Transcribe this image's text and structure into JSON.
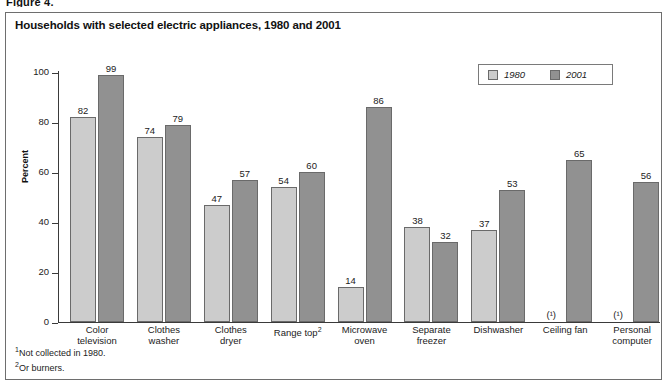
{
  "figure_caption": "Figure 4.",
  "chart_title": "Households with selected electric appliances, 1980 and 2001",
  "legend": {
    "entries": [
      {
        "label": "1980",
        "color": "#cccccc"
      },
      {
        "label": "2001",
        "color": "#919191"
      }
    ]
  },
  "y_axis": {
    "title": "Percent",
    "ticks": [
      "0",
      "20",
      "40",
      "60",
      "80",
      "100"
    ]
  },
  "footnotes": [
    {
      "marker": "1",
      "text": "Not collected in 1980."
    },
    {
      "marker": "2",
      "text": "Or burners."
    }
  ],
  "not_available_marker": "(¹)",
  "chart_data": {
    "type": "bar",
    "title": "Households with selected electric appliances, 1980 and 2001",
    "xlabel": "",
    "ylabel": "Percent",
    "ylim": [
      0,
      100
    ],
    "yticks": [
      0,
      20,
      40,
      60,
      80,
      100
    ],
    "grid": false,
    "legend_position": "top-right",
    "categories": [
      "Color television",
      "Clothes washer",
      "Clothes dryer",
      "Range top",
      "Microwave oven",
      "Separate freezer",
      "Dishwasher",
      "Ceiling fan",
      "Personal computer"
    ],
    "category_labels": [
      {
        "line1": "Color",
        "line2": "television",
        "footnote": ""
      },
      {
        "line1": "Clothes",
        "line2": "washer",
        "footnote": ""
      },
      {
        "line1": "Clothes",
        "line2": "dryer",
        "footnote": ""
      },
      {
        "line1": "Range top",
        "line2": "",
        "footnote": "2"
      },
      {
        "line1": "Microwave",
        "line2": "oven",
        "footnote": ""
      },
      {
        "line1": "Separate",
        "line2": "freezer",
        "footnote": ""
      },
      {
        "line1": "Dishwasher",
        "line2": "",
        "footnote": ""
      },
      {
        "line1": "Ceiling fan",
        "line2": "",
        "footnote": ""
      },
      {
        "line1": "Personal",
        "line2": "computer",
        "footnote": ""
      }
    ],
    "series": [
      {
        "name": "1980",
        "color": "#cccccc",
        "values": [
          82,
          74,
          47,
          54,
          14,
          38,
          37,
          null,
          null
        ]
      },
      {
        "name": "2001",
        "color": "#919191",
        "values": [
          99,
          79,
          57,
          60,
          86,
          32,
          53,
          65,
          56
        ]
      }
    ]
  }
}
